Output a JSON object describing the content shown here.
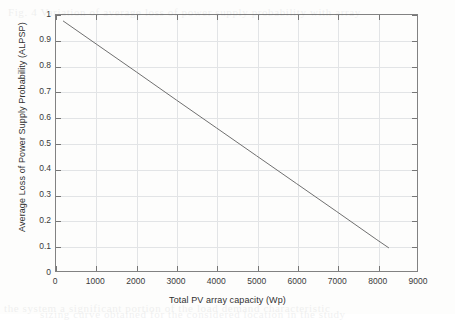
{
  "figure": {
    "background_color": "#fdfdfc",
    "plot_border_color": "#828282",
    "grid_color": "#e2e4e6"
  },
  "chart_data": {
    "type": "line",
    "title": "",
    "subtitle": "",
    "xlabel": "Total PV array capacity (Wp)",
    "ylabel": "Average Loss of Power Supply Probability (ALPSP)",
    "xlim": [
      0,
      9000
    ],
    "ylim": [
      0,
      1
    ],
    "grid": true,
    "legend": null,
    "legend_position": "none",
    "line_color": "#6e6e6e",
    "line_width": 1,
    "xticks": [
      0,
      1000,
      2000,
      3000,
      4000,
      5000,
      6000,
      7000,
      8000,
      9000
    ],
    "xtick_labels": [
      "0",
      "1000",
      "2000",
      "3000",
      "4000",
      "5000",
      "6000",
      "7000",
      "8000",
      "9000"
    ],
    "yticks": [
      0,
      0.1,
      0.2,
      0.3,
      0.4,
      0.5,
      0.6,
      0.7,
      0.8,
      0.9,
      1
    ],
    "ytick_labels": [
      "0",
      "0.1",
      "0.2",
      "0.3",
      "0.4",
      "0.5",
      "0.6",
      "0.7",
      "0.8",
      "0.9",
      "1"
    ],
    "series": [
      {
        "name": "ALPSP vs PV array capacity",
        "x": [
          175,
          1000,
          2000,
          3000,
          4000,
          5000,
          6000,
          7000,
          8000,
          8300
        ],
        "y": [
          0.977,
          0.887,
          0.778,
          0.668,
          0.559,
          0.45,
          0.341,
          0.232,
          0.122,
          0.09
        ]
      }
    ],
    "annotations": []
  },
  "scan_artifacts": {
    "enabled": true,
    "ghost_lines": [
      {
        "text": "Fig. 4 Variation of average loss of power supply probability with array",
        "top": 6,
        "left": 8
      },
      {
        "text": "the system  a  significant  portion  of  the  load  demand  characteristic",
        "top": 302,
        "left": 4
      },
      {
        "text": "sizing  curve  obtained  for  the  considered  location  in  the  study",
        "top": 308,
        "left": 40
      }
    ]
  }
}
